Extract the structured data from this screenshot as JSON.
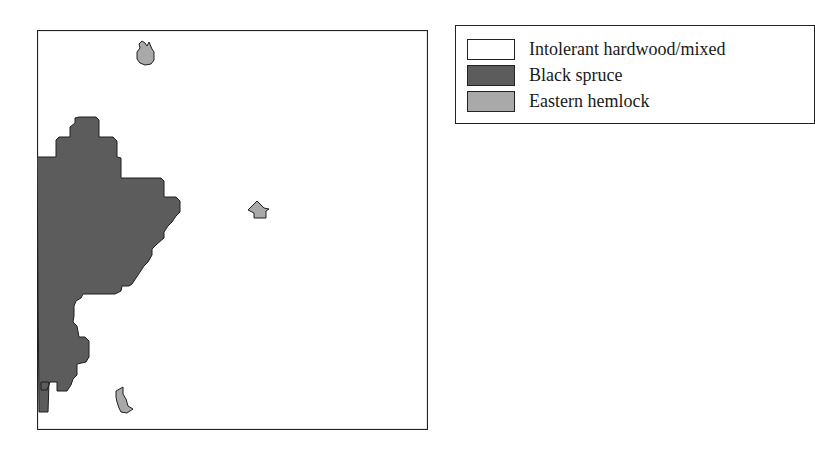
{
  "map": {
    "colors": {
      "frame": "#222222",
      "background": "#ffffff",
      "black_spruce": "#5c5c5c",
      "eastern_hemlock": "#a9a9a9",
      "outline": "#1e1e1e"
    }
  },
  "legend": {
    "items": [
      {
        "label": "Intolerant hardwood/mixed",
        "color": "#ffffff"
      },
      {
        "label": "Black spruce",
        "color": "#5c5c5c"
      },
      {
        "label": "Eastern hemlock",
        "color": "#a9a9a9"
      }
    ]
  }
}
